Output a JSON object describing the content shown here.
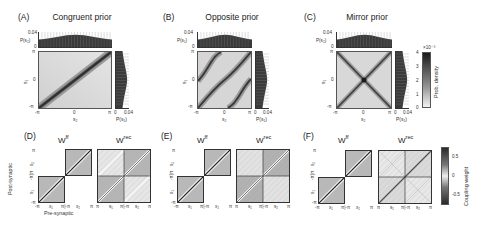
{
  "panels_top": [
    {
      "letter": "(A)",
      "title": "Congruent prior",
      "type": "congruent",
      "top_hist_label": "P(s₂)",
      "right_hist_label": "P(s₁)"
    },
    {
      "letter": "(B)",
      "title": "Opposite prior",
      "type": "opposite",
      "top_hist_label": "P(s₁)",
      "right_hist_label": "P(s₁)"
    },
    {
      "letter": "(C)",
      "title": "Mirror prior",
      "type": "mirror",
      "top_hist_label": "P(s₂)",
      "right_hist_label": "P(s₁)"
    }
  ],
  "top_axes": {
    "hist_y_max": "0.04",
    "hist_y_min": "0",
    "x_ticks": [
      "-π",
      "0",
      "π"
    ],
    "y_ticks": [
      "π",
      "0",
      "-π"
    ],
    "x_label": "s₂",
    "y_label": "s₁",
    "right_hist_ticks": [
      "0",
      "0.04"
    ]
  },
  "colorbar_density": {
    "label": "Prob. density",
    "exponent": "×10⁻³",
    "ticks": [
      "4",
      "3",
      "2",
      "1",
      "0"
    ]
  },
  "panels_bottom": [
    {
      "letter": "(D)",
      "wff": "W",
      "wff_sup": "ff",
      "wrec": "W",
      "wrec_sup": "rec"
    },
    {
      "letter": "(E)",
      "wff": "W",
      "wff_sup": "ff",
      "wrec": "W",
      "wrec_sup": "rec"
    },
    {
      "letter": "(F)",
      "wff": "W",
      "wff_sup": "ff",
      "wrec": "W",
      "wrec_sup": "rec"
    }
  ],
  "bottom_axes": {
    "y_label": "Post-synaptic",
    "x_label": "Pre-synaptic",
    "x_ticks_ff": [
      "-π",
      "x₁",
      "π|-π",
      "x₂",
      "π"
    ],
    "x_ticks_rec": [
      "π",
      "s₁",
      "π|-π",
      "s₂",
      "π"
    ],
    "y_ticks": [
      "π",
      "s₂",
      "-π|π",
      "s₁",
      "-π"
    ]
  },
  "colorbar_weight": {
    "label": "Coupling weight",
    "ticks": [
      "0.5",
      "0",
      "-0.5"
    ]
  },
  "colors": {
    "dark": "#2a2a2a",
    "heat_bg": "#d9d9d9",
    "block_dark": "#a8a8a8",
    "block_light": "#e8e8e8"
  }
}
